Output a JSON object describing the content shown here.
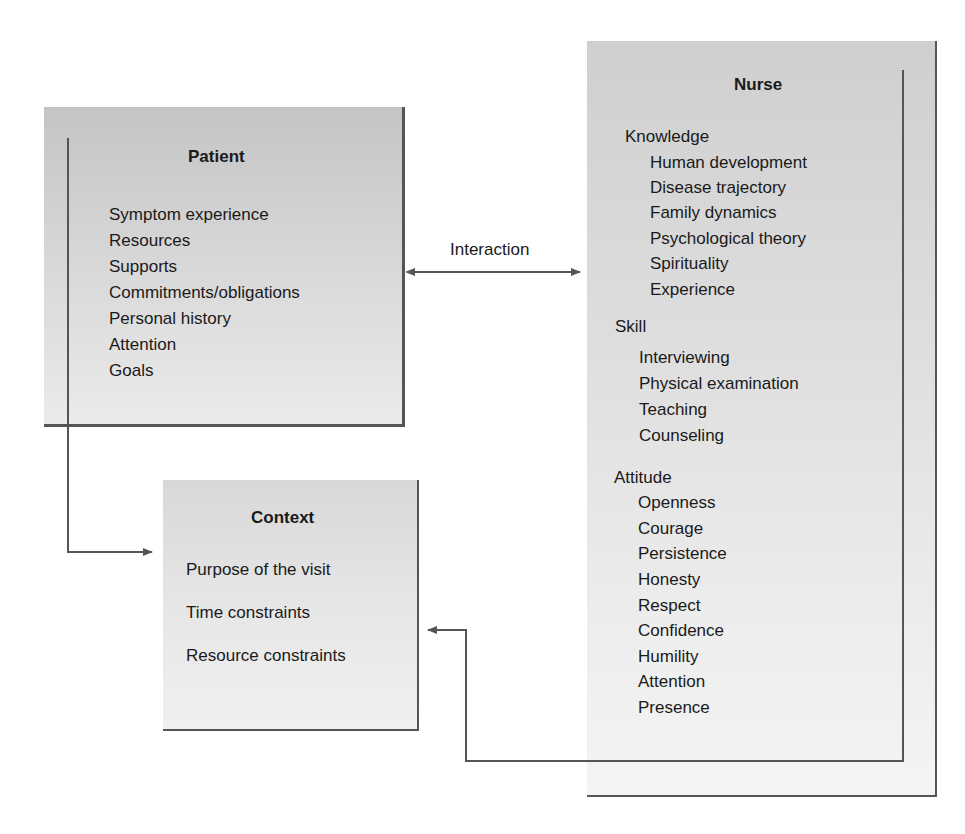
{
  "patient": {
    "title": "Patient",
    "items": [
      "Symptom experience",
      "Resources",
      "Supports",
      "Commitments/obligations",
      "Personal history",
      "Attention",
      "Goals"
    ]
  },
  "context": {
    "title": "Context",
    "items": [
      "Purpose of the visit",
      "Time constraints",
      "Resource constraints"
    ]
  },
  "nurse": {
    "title": "Nurse",
    "sections": [
      {
        "heading": "Knowledge",
        "items": [
          "Human development",
          "Disease trajectory",
          "Family dynamics",
          "Psychological theory",
          "Spirituality",
          "Experience"
        ]
      },
      {
        "heading": "Skill",
        "items": [
          "Interviewing",
          "Physical examination",
          "Teaching",
          "Counseling"
        ]
      },
      {
        "heading": "Attitude",
        "items": [
          "Openness",
          "Courage",
          "Persistence",
          "Honesty",
          "Respect",
          "Confidence",
          "Humility",
          "Attention",
          "Presence"
        ]
      }
    ]
  },
  "connectors": {
    "interaction_label": "Interaction"
  },
  "colors": {
    "line": "#555555",
    "box_fill_top": "#c4c4c4",
    "box_fill_bottom": "#f0f0f0"
  }
}
